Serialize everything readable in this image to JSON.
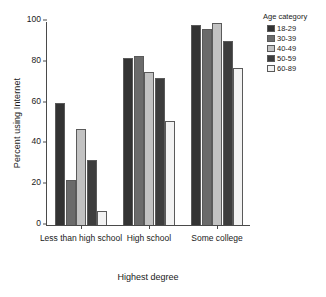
{
  "chart_data": {
    "type": "bar",
    "title": "",
    "xlabel": "Highest degree",
    "ylabel": "Percent using Internet",
    "categories": [
      "Less than high school",
      "High school",
      "Some college"
    ],
    "series": [
      {
        "name": "18-29",
        "color": "#333333",
        "values": [
          60,
          82,
          98
        ]
      },
      {
        "name": "30-39",
        "color": "#6b6b6b",
        "values": [
          22,
          83,
          96
        ]
      },
      {
        "name": "40-49",
        "color": "#c2c2c2",
        "values": [
          47,
          75,
          99
        ]
      },
      {
        "name": "50-59",
        "color": "#3d3d3d",
        "values": [
          32,
          72,
          90
        ]
      },
      {
        "name": "60-89",
        "color": "#f2f2f2",
        "values": [
          7,
          51,
          77
        ]
      }
    ],
    "ylim": [
      0,
      100
    ],
    "yticks": [
      0,
      20,
      40,
      60,
      80,
      100
    ],
    "grid": false,
    "legend": {
      "title": "Age category",
      "position": "right"
    }
  }
}
